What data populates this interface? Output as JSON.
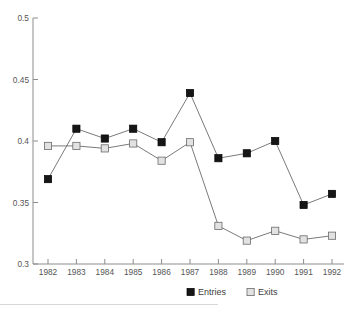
{
  "chart_data": {
    "type": "line",
    "title": "",
    "xlabel": "",
    "ylabel": "",
    "grid": false,
    "legend_position": "bottom-center",
    "categories": [
      "1982",
      "1983",
      "1984",
      "1985",
      "1986",
      "1987",
      "1988",
      "1989",
      "1990",
      "1991",
      "1992"
    ],
    "ylim": [
      0.3,
      0.5
    ],
    "y_ticks": [
      "0.3",
      "0.35",
      "0.4",
      "0.45",
      "0.5"
    ],
    "y_tick_values": [
      0.3,
      0.35,
      0.4,
      0.45,
      0.5
    ],
    "series": [
      {
        "name": "Entries",
        "marker": "filled-square",
        "color": "#161616",
        "values": [
          0.369,
          0.41,
          0.402,
          0.41,
          0.399,
          0.439,
          0.386,
          0.39,
          0.4,
          0.348,
          0.357
        ]
      },
      {
        "name": "Exits",
        "marker": "open-square",
        "color": "#e2e2e2",
        "values": [
          0.396,
          0.396,
          0.394,
          0.398,
          0.384,
          0.399,
          0.331,
          0.319,
          0.327,
          0.32,
          0.323
        ]
      }
    ]
  },
  "legend": {
    "items": [
      {
        "label": "Entries",
        "swatch": "filled-square-swatch"
      },
      {
        "label": "Exits",
        "swatch": "open-square-swatch"
      }
    ]
  },
  "axes": {
    "y_axis_name": "y-axis",
    "x_axis_name": "x-axis"
  },
  "colors": {
    "entries": "#161616",
    "exits": "#e2e2e2",
    "axis": "#8d8d8d",
    "line": "#6b6b6b",
    "text": "#555555",
    "background": "#ffffff"
  }
}
